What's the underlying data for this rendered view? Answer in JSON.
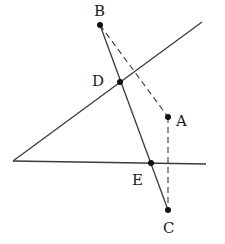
{
  "diagram": {
    "type": "geometry",
    "colors": {
      "line": "#3a3a3a",
      "point": "#111111",
      "text": "#1a1a1a",
      "background": "#ffffff"
    },
    "points": {
      "B": {
        "label": "B",
        "x": 100,
        "y": 25
      },
      "D": {
        "label": "D",
        "x": 120,
        "y": 82
      },
      "A": {
        "label": "A",
        "x": 168,
        "y": 117
      },
      "E": {
        "label": "E",
        "x": 151,
        "y": 163
      },
      "C": {
        "label": "C",
        "x": 168,
        "y": 210
      }
    },
    "angle_vertex": {
      "x": 13,
      "y": 161
    },
    "rays": [
      {
        "name": "upper-ray",
        "from": [
          13,
          161
        ],
        "to": [
          202,
          22
        ]
      },
      {
        "name": "lower-ray",
        "from": [
          13,
          161
        ],
        "to": [
          206,
          164
        ]
      }
    ],
    "solid_segments": [
      {
        "name": "segment-BC",
        "from": "B",
        "to": "C"
      }
    ],
    "dashed_segments": [
      {
        "name": "segment-BA",
        "from": "B",
        "to": "A"
      },
      {
        "name": "segment-AC",
        "from": "A",
        "to": "C"
      }
    ],
    "labels": [
      {
        "text": "B",
        "x": 94,
        "y": 16
      },
      {
        "text": "D",
        "x": 92,
        "y": 86
      },
      {
        "text": "A",
        "x": 176,
        "y": 126
      },
      {
        "text": "E",
        "x": 132,
        "y": 185
      },
      {
        "text": "C",
        "x": 163,
        "y": 233
      }
    ]
  }
}
